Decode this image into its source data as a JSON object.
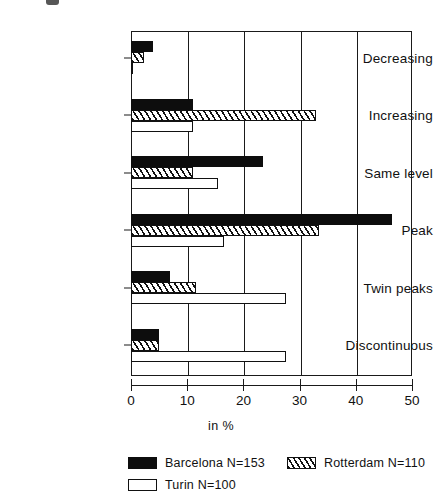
{
  "chart_data": {
    "type": "bar",
    "orientation": "horizontal",
    "title": "",
    "xlabel": "in %",
    "ylabel": "",
    "xlim": [
      0,
      50
    ],
    "xticks": [
      0,
      10,
      20,
      30,
      40,
      50
    ],
    "xtick_labels": [
      "0",
      "10",
      "20",
      "30",
      "40",
      "50"
    ],
    "grid": true,
    "grid_axis": "x",
    "legend_position": "bottom",
    "categories": [
      "Decreasing",
      "Increasing",
      "Same level",
      "Peak",
      "Twin peaks",
      "Discontinuous"
    ],
    "series": [
      {
        "name": "Barcelona N=153",
        "short_name": "Barcelona",
        "n": 153,
        "fill": "solid-black",
        "values": [
          4.0,
          11.0,
          23.5,
          46.5,
          7.0,
          5.0
        ]
      },
      {
        "name": "Rotterdam N=110",
        "short_name": "Rotterdam",
        "n": 110,
        "fill": "diagonal-hatch",
        "values": [
          2.3,
          33.0,
          11.0,
          33.5,
          11.5,
          5.0
        ]
      },
      {
        "name": "Turin N=100",
        "short_name": "Turin",
        "n": 100,
        "fill": "white-outline",
        "values": [
          0.4,
          11.0,
          15.5,
          16.5,
          27.5,
          27.5
        ]
      }
    ]
  },
  "legend": {
    "entries": [
      {
        "label": "Barcelona N=153",
        "key": "barcelona"
      },
      {
        "label": "Rotterdam N=110",
        "key": "rotterdam"
      },
      {
        "label": "Turin N=100",
        "key": "turin"
      }
    ]
  },
  "axis": {
    "x_title": "in %"
  },
  "colors": {
    "barcelona": "#0d0d0d",
    "rotterdam": "#111111",
    "turin": "#ffffff",
    "axis": "#1a1a1a",
    "background": "#ffffff"
  }
}
